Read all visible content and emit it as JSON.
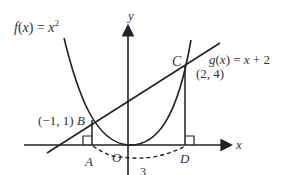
{
  "diagram": {
    "f_label": "f(x) = x",
    "f_exp": "2",
    "g_label": "g(x) = x + 2",
    "point_B": "(−1, 1)",
    "point_B_name": "B",
    "point_C": "(2, 4)",
    "point_C_name": "C",
    "point_A": "A",
    "point_D": "D",
    "origin": "O",
    "x_axis": "x",
    "y_axis": "y",
    "arc_label": "3"
  }
}
